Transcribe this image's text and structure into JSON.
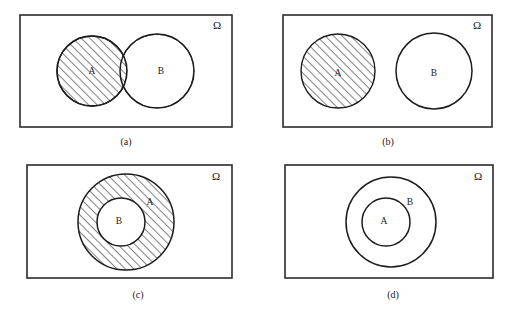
{
  "figure": {
    "background_color": "#ffffff",
    "stroke_color": "#1c1c1c",
    "hatch_color": "#1c1c1c",
    "universe_symbol": "Ω",
    "width": 512,
    "height": 313
  },
  "panels": [
    {
      "id": "a",
      "caption": "(a)",
      "caption_x": 126,
      "caption_y": 143,
      "universe_label": "Ω",
      "universe_label_x": 217,
      "universe_label_y": 26,
      "rect": {
        "x": 20,
        "y": 15,
        "width": 212,
        "height": 112
      },
      "relation": "overlapping",
      "shaded_set": "A",
      "shaded_description": "Set A shaded including the intersection with B",
      "circles": [
        {
          "label": "A",
          "cx": 92,
          "cy": 71,
          "r": 35,
          "label_x": 92,
          "label_y": 72,
          "shaded": true
        },
        {
          "label": "B",
          "cx": 157,
          "cy": 71,
          "r": 37,
          "label_x": 161,
          "label_y": 72,
          "shaded": false
        }
      ]
    },
    {
      "id": "b",
      "caption": "(b)",
      "caption_x": 388,
      "caption_y": 143,
      "universe_label": "Ω",
      "universe_label_x": 477,
      "universe_label_y": 26,
      "rect": {
        "x": 283,
        "y": 15,
        "width": 209,
        "height": 112
      },
      "relation": "disjoint",
      "shaded_set": "A",
      "shaded_description": "Set A shaded, A and B are disjoint",
      "circles": [
        {
          "label": "A",
          "cx": 338,
          "cy": 71,
          "r": 37,
          "label_x": 338,
          "label_y": 74,
          "shaded": true
        },
        {
          "label": "B",
          "cx": 434,
          "cy": 71,
          "r": 38,
          "label_x": 434,
          "label_y": 74,
          "shaded": false
        }
      ]
    },
    {
      "id": "c",
      "caption": "(c)",
      "caption_x": 138,
      "caption_y": 296,
      "universe_label": "Ω",
      "universe_label_x": 216,
      "universe_label_y": 177,
      "rect": {
        "x": 27,
        "y": 165,
        "width": 205,
        "height": 113
      },
      "relation": "b-subset-of-a",
      "shaded_set": "A minus B",
      "shaded_description": "Annulus A \\ B shaded; B lies entirely inside A",
      "circles": [
        {
          "label": "A",
          "cx": 126,
          "cy": 222,
          "r": 48,
          "label_x": 150,
          "label_y": 203,
          "shaded": true
        },
        {
          "label": "B",
          "cx": 121,
          "cy": 222,
          "r": 24,
          "label_x": 119,
          "label_y": 222,
          "shaded": false
        }
      ]
    },
    {
      "id": "d",
      "caption": "(d)",
      "caption_x": 393,
      "caption_y": 296,
      "universe_label": "Ω",
      "universe_label_x": 478,
      "universe_label_y": 177,
      "rect": {
        "x": 285,
        "y": 165,
        "width": 208,
        "height": 113
      },
      "relation": "a-subset-of-b",
      "shaded_set": "none",
      "shaded_description": "No shading; A lies entirely inside B",
      "circles": [
        {
          "label": "B",
          "cx": 391,
          "cy": 222,
          "r": 45,
          "label_x": 410,
          "label_y": 203,
          "shaded": false
        },
        {
          "label": "A",
          "cx": 386,
          "cy": 222,
          "r": 24,
          "label_x": 384,
          "label_y": 222,
          "shaded": false
        }
      ]
    }
  ]
}
